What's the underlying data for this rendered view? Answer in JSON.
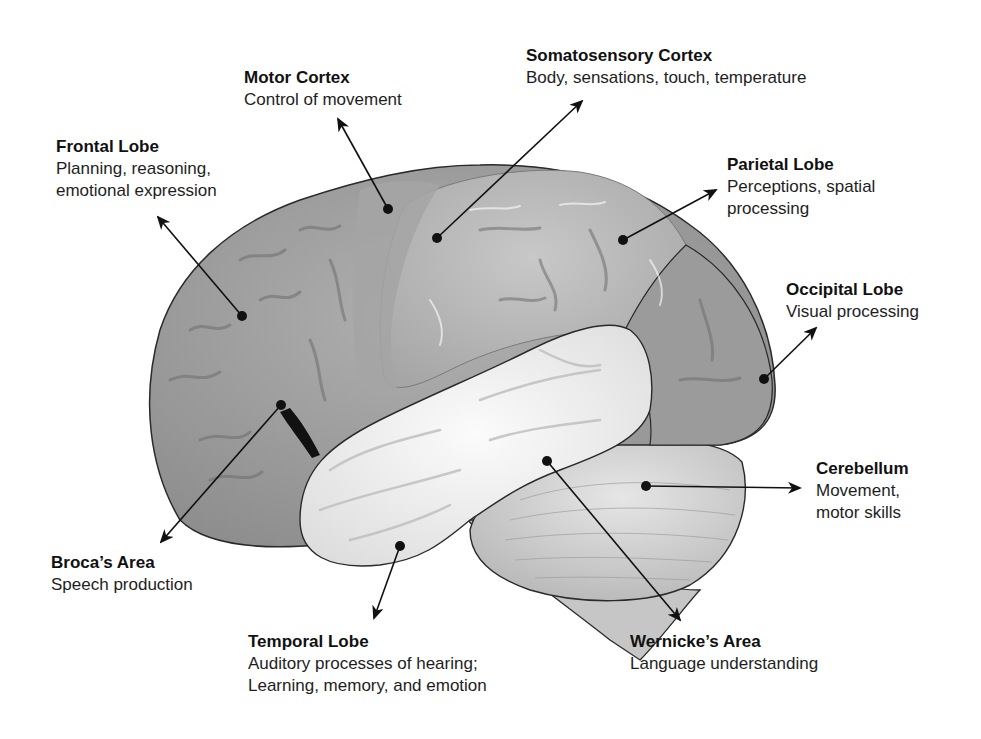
{
  "diagram": {
    "labels": [
      {
        "id": "motor-cortex",
        "title": "Motor Cortex",
        "lines": [
          "Control of movement"
        ],
        "x": 244,
        "y": 67
      },
      {
        "id": "somatosensory-cortex",
        "title": "Somatosensory Cortex",
        "lines": [
          "Body, sensations, touch, temperature"
        ],
        "x": 526,
        "y": 45
      },
      {
        "id": "frontal-lobe",
        "title": "Frontal Lobe",
        "lines": [
          "Planning, reasoning,",
          "emotional expression"
        ],
        "x": 56,
        "y": 136
      },
      {
        "id": "parietal-lobe",
        "title": "Parietal Lobe",
        "lines": [
          "Perceptions, spatial",
          "processing"
        ],
        "x": 727,
        "y": 154
      },
      {
        "id": "occipital-lobe",
        "title": "Occipital Lobe",
        "lines": [
          "Visual processing"
        ],
        "x": 786,
        "y": 279
      },
      {
        "id": "cerebellum",
        "title": "Cerebellum",
        "lines": [
          "Movement,",
          "motor skills"
        ],
        "x": 816,
        "y": 458
      },
      {
        "id": "brocas-area",
        "title": "Broca’s Area",
        "lines": [
          "Speech production"
        ],
        "x": 51,
        "y": 552
      },
      {
        "id": "temporal-lobe",
        "title": "Temporal Lobe",
        "lines": [
          "Auditory processes of hearing;",
          "Learning, memory, and emotion"
        ],
        "x": 248,
        "y": 631
      },
      {
        "id": "wernickes-area",
        "title": "Wernicke’s Area",
        "lines": [
          "Language understanding"
        ],
        "x": 630,
        "y": 631
      }
    ],
    "pointers": [
      {
        "id": "motor-cortex",
        "dot": [
          388,
          209
        ],
        "tip": [
          338,
          119
        ]
      },
      {
        "id": "somatosensory-cortex",
        "dot": [
          437,
          238
        ],
        "tip": [
          582,
          101
        ]
      },
      {
        "id": "frontal-lobe",
        "dot": [
          242,
          316
        ],
        "tip": [
          158,
          217
        ]
      },
      {
        "id": "parietal-lobe",
        "dot": [
          623,
          240
        ],
        "tip": [
          716,
          190
        ]
      },
      {
        "id": "occipital-lobe",
        "dot": [
          764,
          379
        ],
        "tip": [
          816,
          328
        ]
      },
      {
        "id": "cerebellum",
        "dot": [
          646,
          486
        ],
        "tip": [
          800,
          488
        ]
      },
      {
        "id": "brocas-area",
        "dot": [
          281,
          405
        ],
        "tip": [
          161,
          542
        ]
      },
      {
        "id": "temporal-lobe",
        "dot": [
          400,
          546
        ],
        "tip": [
          374,
          618
        ]
      },
      {
        "id": "wernickes-area",
        "dot": [
          547,
          461
        ],
        "tip": [
          680,
          620
        ]
      }
    ],
    "colors": {
      "frontal": "#9d9d9d",
      "parietal": "#b2b2b2",
      "occipital": "#9a9a9a",
      "temporal": "#ededed",
      "cerebellum": "#d2d2d2",
      "brainstem": "#c4c4c4",
      "outline": "#2a2a2a",
      "sulcus": "#6e6e6e",
      "arrow": "#111111"
    }
  }
}
